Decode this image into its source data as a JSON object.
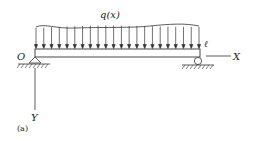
{
  "figure": {
    "load_label": "q(x)",
    "origin_label": "O",
    "length_label": "ℓ",
    "x_axis_label": "X",
    "y_axis_label": "Y",
    "caption": "(a)",
    "arrow_count": 22
  },
  "colors": {
    "stroke": "#333333",
    "background": "#ffffff"
  }
}
